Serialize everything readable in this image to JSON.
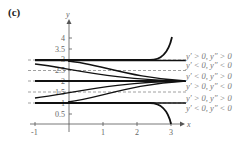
{
  "panel_label": "(c)",
  "axes": {
    "x_label": "x",
    "y_label": "y",
    "x_ticks": [
      "-1",
      "1",
      "2",
      "3"
    ],
    "y_ticks": [
      "4",
      "3.5",
      "3",
      "2.5",
      "2",
      "1.5",
      "1",
      "0.5"
    ]
  },
  "region_labels": [
    "y′ > 0, y″ > 0",
    "y′ < 0, y″ < 0",
    "y′ < 0, y″ > 0",
    "y′ > 0, y″ < 0",
    "y′ > 0, y″ > 0",
    "y′ < 0, y″ < 0"
  ],
  "equilibria": [
    1,
    2,
    3
  ],
  "inflection_dashes": [
    1.5,
    2.5
  ]
}
